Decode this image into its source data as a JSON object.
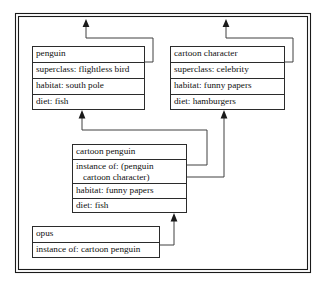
{
  "diagram": {
    "frame": {
      "border_color": "#1a1a1a"
    },
    "line_color": "#404040",
    "nodes": [
      {
        "id": "penguin",
        "name": "penguin-frame",
        "header": "penguin",
        "rows": [
          "superclass: flightless bird",
          "habitat: south pole",
          "diet: fish"
        ]
      },
      {
        "id": "cartoon-character",
        "name": "cartoon-character-frame",
        "header": "cartoon character",
        "rows": [
          "superclass: celebrity",
          "habitat: funny papers",
          "diet: hamburgers"
        ]
      },
      {
        "id": "cartoon-penguin",
        "name": "cartoon-penguin-frame",
        "header": "cartoon penguin",
        "rows": [
          "instance of: (penguin\n   cartoon character)",
          "habitat: funny papers",
          "diet: fish"
        ]
      },
      {
        "id": "opus",
        "name": "opus-frame",
        "header": "opus",
        "rows": [
          "instance of: cartoon penguin"
        ]
      }
    ],
    "connectors": [
      {
        "id": "penguin-superclass-up",
        "label": "penguin superclass link"
      },
      {
        "id": "cartoon-character-superclass-up",
        "label": "cartoon character superclass link"
      },
      {
        "id": "cartoon-penguin-to-penguin",
        "label": "cartoon penguin instance of penguin"
      },
      {
        "id": "cartoon-penguin-to-cartoon-character",
        "label": "cartoon penguin instance of cartoon character"
      },
      {
        "id": "opus-to-cartoon-penguin",
        "label": "opus instance of cartoon penguin"
      }
    ]
  }
}
